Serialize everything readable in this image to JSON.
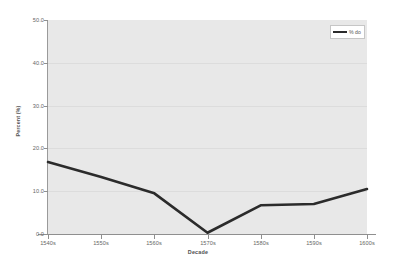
{
  "chart_data": {
    "type": "line",
    "title": "",
    "xlabel": "Decade",
    "ylabel": "Percent (%)",
    "categories": [
      "1540s",
      "1550s",
      "1560s",
      "1570s",
      "1580s",
      "1590s",
      "1600s"
    ],
    "series": [
      {
        "name": "% do",
        "values": [
          16.8,
          13.3,
          9.5,
          0.3,
          6.7,
          7.0,
          10.5
        ]
      }
    ],
    "ylim": [
      0.0,
      50.0
    ],
    "ytick_labels": [
      "50.0",
      "40.0",
      "30.0",
      "20.0",
      "10.0",
      "0.0"
    ],
    "ytick_values": [
      50.0,
      40.0,
      30.0,
      20.0,
      10.0,
      0.0
    ],
    "grid": true,
    "legend_position": "top-right",
    "colors": {
      "line": "#2b2b2b",
      "plot_background": "#e8e8e8",
      "figure_background": "#ffffff",
      "gridline": "#dcdcdc",
      "axis": "#8f8f8f",
      "tick_text": "#666666"
    }
  },
  "legend": {
    "entries": [
      {
        "label": "% do"
      }
    ]
  }
}
